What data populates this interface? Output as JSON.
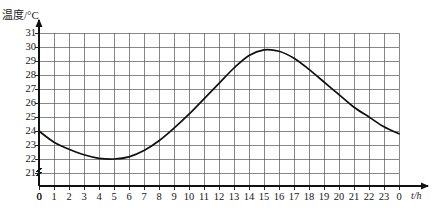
{
  "chart_data": {
    "type": "line",
    "title": "",
    "subtitle": "",
    "xlabel": "t/h",
    "ylabel": "温度/°C",
    "x_tick_labels": [
      "0",
      "1",
      "2",
      "3",
      "4",
      "5",
      "6",
      "7",
      "8",
      "9",
      "10",
      "11",
      "12",
      "13",
      "14",
      "15",
      "16",
      "17",
      "18",
      "19",
      "20",
      "21",
      "22",
      "23",
      "0"
    ],
    "y_tick_labels": [
      "21",
      "22",
      "23",
      "24",
      "25",
      "26",
      "27",
      "28",
      "29",
      "30",
      "31"
    ],
    "origin_label": "0",
    "xlim": [
      0,
      24
    ],
    "ylim": [
      20.5,
      31.3
    ],
    "y_axis_break": true,
    "grid": true,
    "grid_x_step": 1,
    "grid_y_step": 1,
    "legend": "none",
    "series": [
      {
        "name": "温度",
        "x": [
          0,
          1,
          2,
          3,
          4,
          5,
          6,
          7,
          8,
          9,
          10,
          11,
          12,
          13,
          14,
          15,
          16,
          17,
          18,
          19,
          20,
          21,
          22,
          23,
          24
        ],
        "values": [
          24.0,
          23.2,
          22.7,
          22.3,
          22.05,
          22.0,
          22.15,
          22.6,
          23.3,
          24.2,
          25.2,
          26.3,
          27.4,
          28.5,
          29.4,
          29.8,
          29.7,
          29.2,
          28.4,
          27.5,
          26.6,
          25.7,
          25.0,
          24.3,
          23.8
        ]
      }
    ],
    "annotations": {
      "minimum": {
        "x": 5,
        "y": 22.0
      },
      "maximum": {
        "x": 15,
        "y": 29.8
      },
      "start": {
        "x": 0,
        "y": 24.0
      },
      "end": {
        "x": 24,
        "y": 23.8
      }
    },
    "colors": {
      "curve": "#101010",
      "grid": "#555555",
      "axis": "#111111",
      "background": "#ffffff"
    }
  }
}
